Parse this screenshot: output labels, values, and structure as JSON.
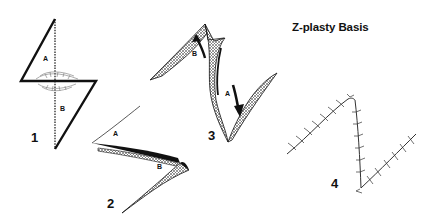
{
  "title": "Z-plasty Basis",
  "figures": [
    {
      "number": "1",
      "labels": [
        "A",
        "B"
      ]
    },
    {
      "number": "2",
      "labels": [
        "A",
        "B"
      ]
    },
    {
      "number": "3",
      "labels": [
        "A",
        "B"
      ]
    },
    {
      "number": "4",
      "labels": []
    }
  ]
}
